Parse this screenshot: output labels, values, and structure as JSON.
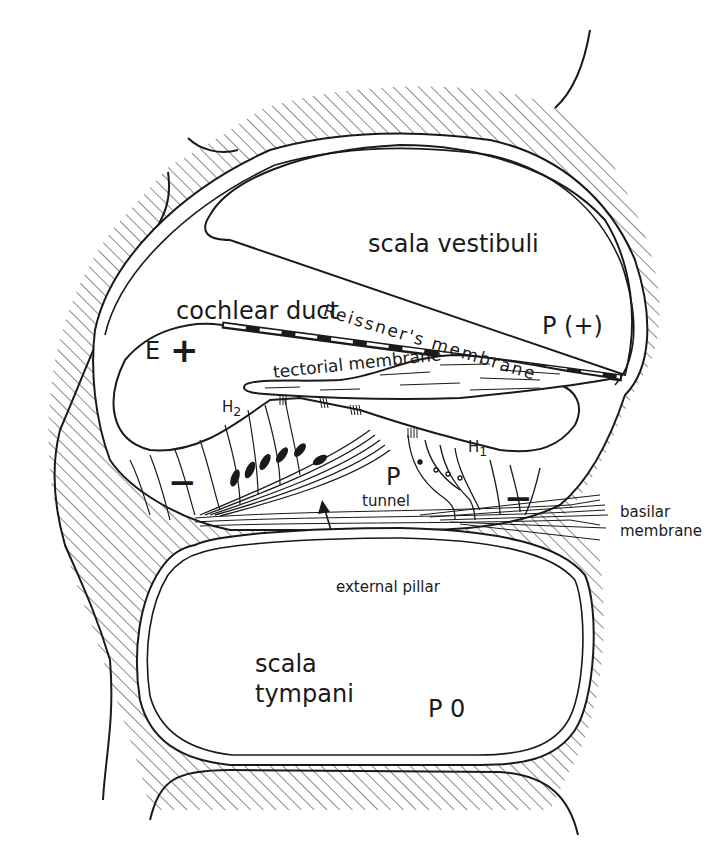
{
  "diagram": {
    "type": "anatomical cross-section",
    "regions": {
      "scala_vestibuli": {
        "label": "scala vestibuli",
        "potential": "P (+)"
      },
      "cochlear_duct": {
        "label": "cochlear duct",
        "potential_label": "E",
        "potential_sign": "+"
      },
      "scala_tympani": {
        "label_line1": "scala",
        "label_line2": "tympani",
        "potential": "P 0"
      },
      "tunnel": {
        "label": "tunnel",
        "potential": "P"
      }
    },
    "structures": {
      "reissners_membrane": "Reissner's membrane",
      "tectorial_membrane": "tectorial membrane",
      "basilar_membrane_line1": "basilar",
      "basilar_membrane_line2": "membrane",
      "external_pillar": "external pillar",
      "outer_hair_cells": "H",
      "outer_hair_cells_sub": "2",
      "inner_hair_cells": "H",
      "inner_hair_cells_sub": "1"
    },
    "signs": {
      "left_negative": "−",
      "right_negative": "−"
    },
    "colors": {
      "ink": "#1a1a1a",
      "background": "#ffffff"
    }
  }
}
